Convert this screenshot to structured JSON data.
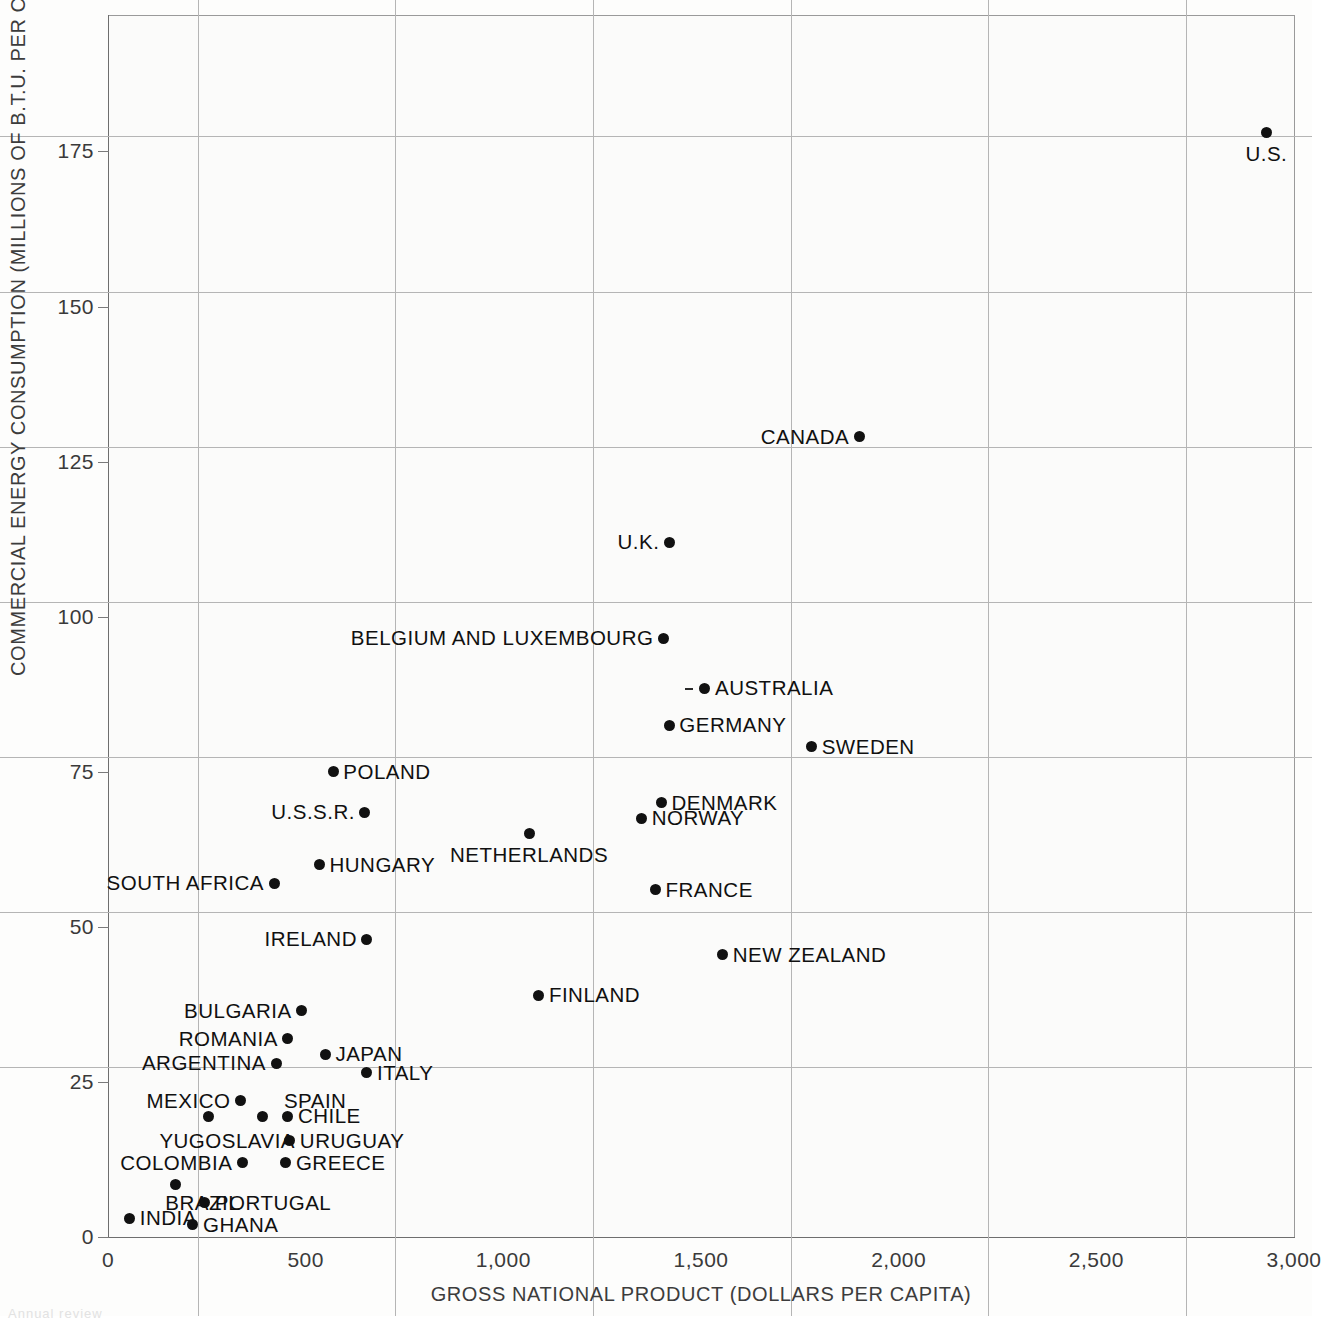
{
  "chart_data": {
    "type": "scatter",
    "title": "",
    "xlabel": "GROSS NATIONAL PRODUCT (DOLLARS PER CAPITA)",
    "ylabel": "COMMERCIAL ENERGY CONSUMPTION (MILLIONS OF B.T.U. PER CAPITA)",
    "xlim": [
      0,
      3000
    ],
    "ylim": [
      0,
      197
    ],
    "xticks": [
      "0",
      "500",
      "1,000",
      "1,500",
      "2,000",
      "2,500",
      "3,000"
    ],
    "xtick_values": [
      0,
      500,
      1000,
      1500,
      2000,
      2500,
      3000
    ],
    "yticks": [
      "0",
      "25",
      "50",
      "75",
      "100",
      "125",
      "150",
      "175"
    ],
    "ytick_values": [
      0,
      25,
      50,
      75,
      100,
      125,
      150,
      175
    ],
    "grid": true,
    "legend": "none",
    "points": [
      {
        "label": "U.S.",
        "x": 2930,
        "y": 178,
        "label_pos": "below"
      },
      {
        "label": "CANADA",
        "x": 1900,
        "y": 129,
        "label_pos": "left"
      },
      {
        "label": "U.K.",
        "x": 1420,
        "y": 112,
        "label_pos": "left"
      },
      {
        "label": "BELGIUM AND LUXEMBOURG",
        "x": 1405,
        "y": 96.5,
        "label_pos": "left"
      },
      {
        "label": "AUSTRALIA",
        "x": 1510,
        "y": 88.5,
        "label_pos": "right"
      },
      {
        "label": "GERMANY",
        "x": 1420,
        "y": 82.5,
        "label_pos": "right"
      },
      {
        "label": "SWEDEN",
        "x": 1780,
        "y": 79,
        "label_pos": "right"
      },
      {
        "label": "POLAND",
        "x": 570,
        "y": 75,
        "label_pos": "right"
      },
      {
        "label": "DENMARK",
        "x": 1400,
        "y": 70,
        "label_pos": "right"
      },
      {
        "label": "U.S.S.R.",
        "x": 650,
        "y": 68.5,
        "label_pos": "left"
      },
      {
        "label": "NORWAY",
        "x": 1350,
        "y": 67.5,
        "label_pos": "right"
      },
      {
        "label": "NETHERLANDS",
        "x": 1065,
        "y": 65,
        "label_pos": "below"
      },
      {
        "label": "HUNGARY",
        "x": 535,
        "y": 60,
        "label_pos": "right"
      },
      {
        "label": "SOUTH AFRICA",
        "x": 420,
        "y": 57,
        "label_pos": "left"
      },
      {
        "label": "FRANCE",
        "x": 1385,
        "y": 56,
        "label_pos": "right"
      },
      {
        "label": "IRELAND",
        "x": 655,
        "y": 48,
        "label_pos": "left"
      },
      {
        "label": "NEW ZEALAND",
        "x": 1555,
        "y": 45.5,
        "label_pos": "right"
      },
      {
        "label": "FINLAND",
        "x": 1090,
        "y": 39,
        "label_pos": "right"
      },
      {
        "label": "BULGARIA",
        "x": 490,
        "y": 36.5,
        "label_pos": "left"
      },
      {
        "label": "ROMANIA",
        "x": 455,
        "y": 32,
        "label_pos": "left"
      },
      {
        "label": "JAPAN",
        "x": 550,
        "y": 29.5,
        "label_pos": "right"
      },
      {
        "label": "ARGENTINA",
        "x": 425,
        "y": 28,
        "label_pos": "left"
      },
      {
        "label": "ITALY",
        "x": 655,
        "y": 26.5,
        "label_pos": "right"
      },
      {
        "label": "MEXICO",
        "x": 335,
        "y": 22,
        "label_pos": "left"
      },
      {
        "label": "SPAIN",
        "x": 390,
        "y": 19.5,
        "label_pos": "none"
      },
      {
        "label": "YUGOSLAVIA",
        "x": 255,
        "y": 19.5,
        "label_pos": "none"
      },
      {
        "label": "CHILE",
        "x": 455,
        "y": 19.5,
        "label_pos": "right"
      },
      {
        "label": "URUGUAY",
        "x": 460,
        "y": 15.5,
        "label_pos": "right"
      },
      {
        "label": "COLOMBIA",
        "x": 340,
        "y": 12,
        "label_pos": "left"
      },
      {
        "label": "GREECE",
        "x": 450,
        "y": 12,
        "label_pos": "right"
      },
      {
        "label": "BRAZIL",
        "x": 170,
        "y": 8.5,
        "label_pos": "none"
      },
      {
        "label": "PORTUGAL",
        "x": 245,
        "y": 5.5,
        "label_pos": "right"
      },
      {
        "label": "INDIA",
        "x": 55,
        "y": 3,
        "label_pos": "right"
      },
      {
        "label": "GHANA",
        "x": 215,
        "y": 2,
        "label_pos": "right"
      }
    ],
    "floating_labels": [
      {
        "text": "SPAIN",
        "x": 445,
        "y": 22
      },
      {
        "text": "YUGOSLAVIA",
        "x": 130,
        "y": 15.5
      },
      {
        "text": "BRAZIL",
        "x": 145,
        "y": 5.5
      }
    ]
  },
  "figure": {
    "background_color": "#fbfbfa",
    "grid_color": "#b5b5b5",
    "axis_color": "#6e6e6e",
    "point_color": "#111111",
    "text_color": "#101010",
    "bottom_caption": "Annual   review"
  }
}
